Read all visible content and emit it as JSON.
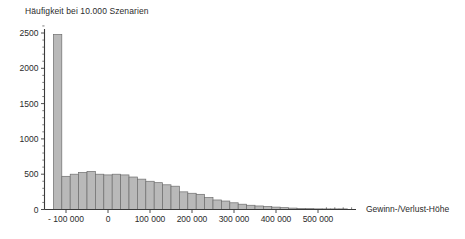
{
  "chart_data": {
    "type": "bar",
    "title": "Häufigkeit bei 10.000 Szenarien",
    "subtitle": "",
    "xlabel": "Gewinn-/Verlust-Höhe",
    "ylabel": "",
    "grid": false,
    "legend": null,
    "xlim": [
      -130000,
      570000
    ],
    "ylim": [
      0,
      2600
    ],
    "ytick_labels": [
      "0",
      "500",
      "1000",
      "1500",
      "2000",
      "2500"
    ],
    "ytick_values": [
      0,
      500,
      1000,
      1500,
      2000,
      2500
    ],
    "yminor_step": 100,
    "xtick_labels": [
      "- 100 000",
      "0",
      "100 000",
      "200 000",
      "300 000",
      "400 000",
      "500 000"
    ],
    "xtick_values": [
      -100000,
      0,
      100000,
      200000,
      300000,
      400000,
      500000
    ],
    "bin_width": 20000,
    "bin_starts": [
      -130000,
      -110000,
      -90000,
      -70000,
      -50000,
      -30000,
      -10000,
      10000,
      30000,
      50000,
      70000,
      90000,
      110000,
      130000,
      150000,
      170000,
      190000,
      210000,
      230000,
      250000,
      270000,
      290000,
      310000,
      330000,
      350000,
      370000,
      390000,
      410000,
      430000,
      450000,
      470000,
      490000,
      510000,
      530000,
      550000
    ],
    "categories": [
      "-130k",
      "-110k",
      "-90k",
      "-70k",
      "-50k",
      "-30k",
      "-10k",
      "10k",
      "30k",
      "50k",
      "70k",
      "90k",
      "110k",
      "130k",
      "150k",
      "170k",
      "190k",
      "210k",
      "230k",
      "250k",
      "270k",
      "290k",
      "310k",
      "330k",
      "350k",
      "370k",
      "390k",
      "410k",
      "430k",
      "450k",
      "470k",
      "490k",
      "510k",
      "530k",
      "550k"
    ],
    "values": [
      2480,
      470,
      500,
      525,
      540,
      500,
      490,
      500,
      490,
      460,
      430,
      400,
      380,
      350,
      330,
      250,
      230,
      215,
      170,
      135,
      120,
      95,
      75,
      60,
      50,
      42,
      34,
      26,
      20,
      16,
      12,
      9,
      7,
      5,
      4
    ]
  },
  "colors": {
    "bar_fill": "#b9b9b9",
    "bar_stroke": "#6e6e6e",
    "axis": "#3a3a3a",
    "text": "#2b2b2b",
    "background": "#ffffff"
  }
}
